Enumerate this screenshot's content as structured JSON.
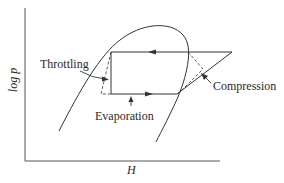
{
  "figure": {
    "type": "log p - H diagram (vapor-compression refrigeration cycle)",
    "axes": {
      "x_label": "H",
      "y_label": "log p"
    },
    "annotations": {
      "throttling": "Throttling",
      "compression": "Compression",
      "evaporation": "Evaporation"
    },
    "colors": {
      "line": "#333333",
      "background": "#ffffff"
    }
  }
}
